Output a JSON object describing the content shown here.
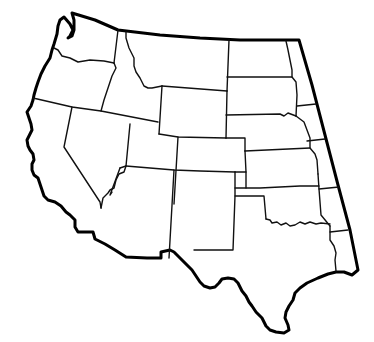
{
  "map": {
    "title": "",
    "region": "Western United States",
    "style": "blank outline map",
    "colors": {
      "background": "#ffffff",
      "line": "#000000"
    },
    "states": [
      {
        "id": "washington",
        "label": ""
      },
      {
        "id": "oregon",
        "label": ""
      },
      {
        "id": "california",
        "label": ""
      },
      {
        "id": "idaho",
        "label": ""
      },
      {
        "id": "nevada",
        "label": ""
      },
      {
        "id": "montana",
        "label": ""
      },
      {
        "id": "wyoming",
        "label": ""
      },
      {
        "id": "utah",
        "label": ""
      },
      {
        "id": "arizona",
        "label": ""
      },
      {
        "id": "colorado",
        "label": ""
      },
      {
        "id": "new-mexico",
        "label": ""
      },
      {
        "id": "north-dakota",
        "label": ""
      },
      {
        "id": "south-dakota",
        "label": ""
      },
      {
        "id": "nebraska",
        "label": ""
      },
      {
        "id": "kansas",
        "label": ""
      },
      {
        "id": "oklahoma",
        "label": ""
      },
      {
        "id": "texas",
        "label": ""
      },
      {
        "id": "minnesota-strip",
        "label": ""
      },
      {
        "id": "iowa-strip",
        "label": ""
      },
      {
        "id": "missouri-strip",
        "label": ""
      },
      {
        "id": "arkansas-strip",
        "label": ""
      },
      {
        "id": "louisiana-strip",
        "label": ""
      }
    ]
  }
}
